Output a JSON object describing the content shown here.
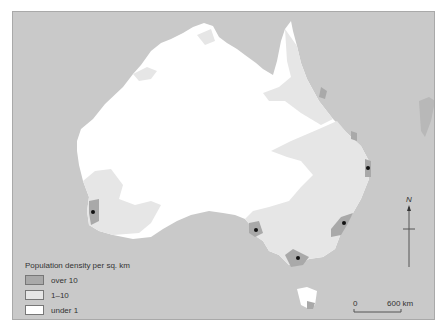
{
  "legend": {
    "title": "Population density per sq. km",
    "items": [
      {
        "label": "over 10",
        "color": "#a9a9a9"
      },
      {
        "label": "1–10",
        "color": "#e6e6e6"
      },
      {
        "label": "under 1",
        "color": "#ffffff"
      }
    ],
    "cities_label": "cities with over 500 000 population"
  },
  "north_arrow": {
    "label": "N"
  },
  "scale_bar": {
    "start": "0",
    "end": "600 km"
  },
  "colors": {
    "sea": "#c9c9c9",
    "over_10": "#a9a9a9",
    "range_1_10": "#e6e6e6",
    "under_1": "#ffffff",
    "city_dot": "#111111"
  },
  "cities": [
    {
      "name": "Perth",
      "x": 92,
      "y": 211
    },
    {
      "name": "Adelaide",
      "x": 255,
      "y": 229
    },
    {
      "name": "Melbourne",
      "x": 297,
      "y": 257
    },
    {
      "name": "Sydney",
      "x": 343,
      "y": 222
    },
    {
      "name": "Brisbane",
      "x": 367,
      "y": 167
    }
  ]
}
